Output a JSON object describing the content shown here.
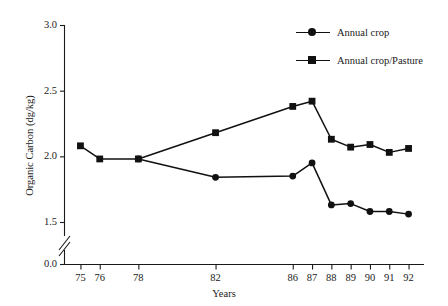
{
  "chart_data": {
    "type": "line",
    "title": "",
    "xlabel": "Years",
    "ylabel": "Organic Carbon (dg/kg)",
    "x": [
      75,
      76,
      78,
      82,
      86,
      87,
      88,
      89,
      90,
      91,
      92
    ],
    "xtick_labels": [
      "75",
      "76",
      "78",
      "82",
      "86",
      "87",
      "88",
      "89",
      "90",
      "91",
      "92"
    ],
    "ytick_labels": [
      "0.0",
      "1.5",
      "2.0",
      "2.5",
      "3.0"
    ],
    "yticks": [
      0.0,
      1.5,
      2.0,
      2.5,
      3.0
    ],
    "ylim": [
      1.5,
      3.0
    ],
    "xlim": [
      74.2,
      92.8
    ],
    "axis_break": true,
    "axis_break_note": "y-axis broken between 0.0 and 1.5",
    "grid": false,
    "legend_position": "top-right",
    "series": [
      {
        "name": "Annual crop",
        "marker": "circle",
        "color": "#111111",
        "x": [
          78,
          82,
          86,
          87,
          88,
          89,
          90,
          91,
          92
        ],
        "values": [
          1.98,
          1.84,
          1.85,
          1.95,
          1.63,
          1.64,
          1.58,
          1.58,
          1.56
        ]
      },
      {
        "name": "Annual crop/Pasture",
        "marker": "square",
        "color": "#111111",
        "x": [
          75,
          76,
          78,
          82,
          86,
          87,
          88,
          89,
          90,
          91,
          92
        ],
        "values": [
          2.08,
          1.98,
          1.98,
          2.18,
          2.38,
          2.42,
          2.13,
          2.07,
          2.09,
          2.03,
          2.06
        ]
      }
    ]
  },
  "legend": {
    "items": [
      {
        "label": "Annual crop",
        "marker": "circle"
      },
      {
        "label": "Annual crop/Pasture",
        "marker": "square"
      }
    ]
  }
}
